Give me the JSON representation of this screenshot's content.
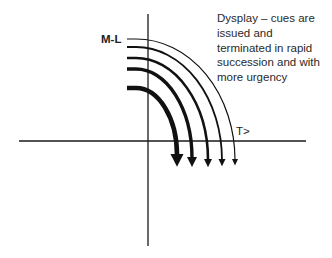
{
  "diagram": {
    "labels": {
      "y_axis_label": "M-L",
      "x_axis_label": "T>"
    },
    "annotation": {
      "lines": [
        "Dysplay – cues are",
        "issued and",
        "terminated in rapid",
        "succession and with",
        "more urgency"
      ]
    },
    "axes": {
      "origin": [
        148,
        141
      ],
      "x_range": [
        19,
        306
      ],
      "y_range": [
        14,
        246
      ],
      "color": "#1a1a1a"
    },
    "arcs": [
      {
        "start_y": 39,
        "end_x": 235,
        "end_y": 160,
        "stroke_width": 1.2,
        "head": 6
      },
      {
        "start_y": 47,
        "end_x": 222,
        "end_y": 160,
        "stroke_width": 1.8,
        "head": 7
      },
      {
        "start_y": 58,
        "end_x": 208,
        "end_y": 160,
        "stroke_width": 2.6,
        "head": 8
      },
      {
        "start_y": 69,
        "end_x": 192,
        "end_y": 158,
        "stroke_width": 3.4,
        "head": 10
      },
      {
        "start_y": 88,
        "end_x": 177,
        "end_y": 155,
        "stroke_width": 4.6,
        "head": 13
      }
    ],
    "arc_start_x": 127,
    "stroke_color": "#111111"
  }
}
